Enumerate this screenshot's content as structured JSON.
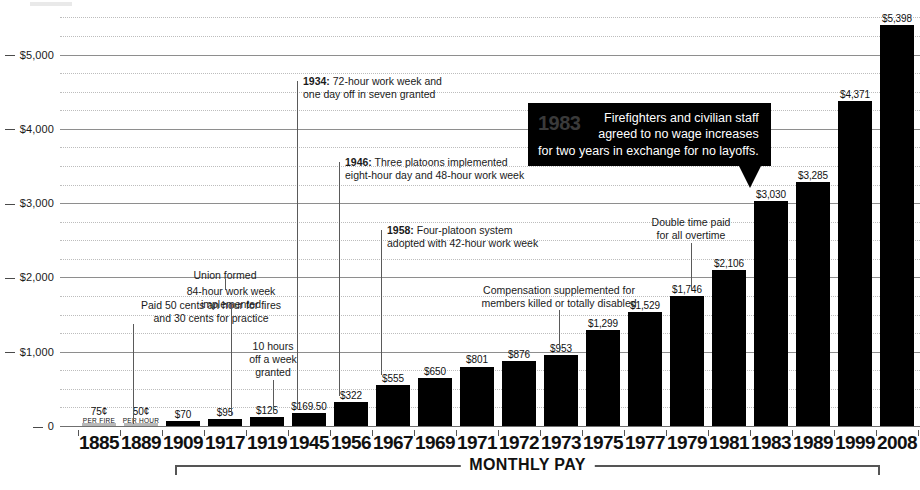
{
  "chart_data": {
    "type": "bar",
    "title": "",
    "xlabel": "MONTHLY PAY",
    "ylabel": "",
    "ylim": [
      0,
      5600
    ],
    "grid": true,
    "legend": "none",
    "categories": [
      "1885",
      "1889",
      "1909",
      "1917",
      "1919",
      "1945",
      "1956",
      "1967",
      "1969",
      "1971",
      "1972",
      "1973",
      "1975",
      "1977",
      "1979",
      "1981",
      "1983",
      "1989",
      "1999",
      "2008"
    ],
    "values": [
      0,
      0,
      70,
      95,
      125,
      169.5,
      322,
      555,
      650,
      801,
      876,
      953,
      1299,
      1529,
      1746,
      2106,
      3030,
      3285,
      4371,
      5398
    ],
    "value_labels": [
      "75¢",
      "50¢",
      "$70",
      "$95",
      "$125",
      "$169.50",
      "$322",
      "$555",
      "$650",
      "$801",
      "$876",
      "$953",
      "$1,299",
      "$1,529",
      "$1,746",
      "$2,106",
      "$3,030",
      "$3,285",
      "$4,371",
      "$5,398"
    ],
    "value_sublabels": [
      "PER FIRE",
      "PER HOUR",
      "",
      "",
      "",
      "",
      "",
      "",
      "",
      "",
      "",
      "",
      "",
      "",
      "",
      "",
      "",
      "",
      "",
      ""
    ],
    "ytick_labels": [
      "0",
      "$1,000",
      "$2,000",
      "$3,000",
      "$4,000",
      "$5,000"
    ],
    "ytick_values": [
      0,
      1000,
      2000,
      3000,
      4000,
      5000
    ],
    "minor_gridline_step": 250,
    "bar_color": "#000000",
    "faint_bar_color": "#b8b8b8",
    "gridline_color": "#8e8e8e"
  },
  "annotations": [
    {
      "id": "paid-50-cents",
      "line1": "Paid 50 cents an hour for fires",
      "line2": "and 30 cents for practice"
    },
    {
      "id": "union-formed",
      "line1": "Union formed",
      "line2": ""
    },
    {
      "id": "84-hour-week",
      "line1": "84-hour work week",
      "line2": "implemented"
    },
    {
      "id": "10-hours-off",
      "line1": "10 hours",
      "line2": "off a week",
      "line3": "granted"
    },
    {
      "id": "1934-note",
      "year": "1934:",
      "line1": " 72-hour work week and",
      "line2": "one day off in seven granted"
    },
    {
      "id": "1946-note",
      "year": "1946:",
      "line1": " Three platoons implemented",
      "line2": "eight-hour day and 48-hour work week"
    },
    {
      "id": "1958-note",
      "year": "1958:",
      "line1": " Four-platoon system",
      "line2": "adopted with 42-hour work week"
    },
    {
      "id": "compensation",
      "line1": "Compensation supplemented for",
      "line2": "members killed or totally disabled"
    },
    {
      "id": "double-time",
      "line1": "Double time paid",
      "line2": "for all overtime"
    }
  ],
  "callout": {
    "year": "1983",
    "line1": "Firefighters and civilian staff",
    "line2": "agreed to no wage increases",
    "line3": "for two years in exchange for no layoffs.",
    "background": "#000000",
    "text_color": "#ffffff",
    "year_color": "#3a3a3a"
  }
}
